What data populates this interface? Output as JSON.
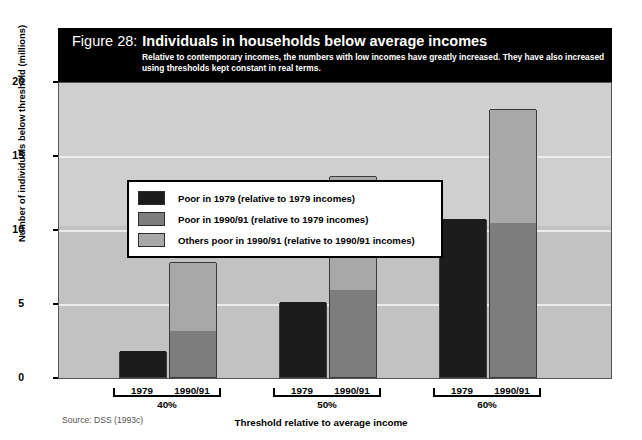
{
  "header": {
    "figure_number": "Figure 28:",
    "title": "Individuals in households below average incomes",
    "subtitle": "Relative to contemporary incomes, the numbers with low incomes have greatly increased. They have also increased using thresholds kept constant in real terms."
  },
  "source": "Source: DSS (1993c)",
  "colors": {
    "banner_background": "#000000",
    "banner_text": "#ffffff",
    "plot_background": "#c9c9c9",
    "gridline": "#ececec",
    "series_1": "#1c1c1c",
    "series_2": "#7d7d7d",
    "series_3": "#a8a8a8",
    "axis": "#000000"
  },
  "chart_data": {
    "type": "bar",
    "subtype": "stacked-grouped",
    "title": "Individuals in households below average incomes",
    "xlabel": "Threshold relative to average income",
    "ylabel": "Number of individuals below threshold (millions)",
    "ylim": [
      0,
      20
    ],
    "yticks": [
      "0",
      "5",
      "10",
      "15",
      "20"
    ],
    "ytick_values": [
      0,
      5,
      10,
      15,
      20
    ],
    "grid": true,
    "legend_position": "inside-top-left",
    "groups": [
      "40%",
      "50%",
      "60%"
    ],
    "subcategories": [
      "1979",
      "1990/91"
    ],
    "series": [
      {
        "name": "Poor in 1979 (relative to 1979 incomes)",
        "color": "#1c1c1c",
        "values": [
          1.75,
          null,
          5.1,
          null,
          10.7,
          null
        ]
      },
      {
        "name": "Poor in 1990/91 (relative to 1979 incomes)",
        "color": "#7d7d7d",
        "values": [
          null,
          3.1,
          null,
          5.85,
          null,
          10.4
        ]
      },
      {
        "name": "Others poor in 1990/91 (relative to 1990/91 incomes)",
        "color": "#a8a8a8",
        "values": [
          null,
          4.65,
          null,
          7.75,
          null,
          7.7
        ]
      }
    ],
    "bars": [
      {
        "group": "40%",
        "sub": "1979",
        "total": 1.75,
        "segments": [
          {
            "series": 0,
            "value": 1.75
          }
        ]
      },
      {
        "group": "40%",
        "sub": "1990/91",
        "total": 7.75,
        "segments": [
          {
            "series": 1,
            "value": 3.1
          },
          {
            "series": 2,
            "value": 4.65
          }
        ]
      },
      {
        "group": "50%",
        "sub": "1979",
        "total": 5.1,
        "segments": [
          {
            "series": 0,
            "value": 5.1
          }
        ]
      },
      {
        "group": "50%",
        "sub": "1990/91",
        "total": 13.6,
        "segments": [
          {
            "series": 1,
            "value": 5.85
          },
          {
            "series": 2,
            "value": 7.75
          }
        ]
      },
      {
        "group": "60%",
        "sub": "1979",
        "total": 10.7,
        "segments": [
          {
            "series": 0,
            "value": 10.7
          }
        ]
      },
      {
        "group": "60%",
        "sub": "1990/91",
        "total": 18.1,
        "segments": [
          {
            "series": 1,
            "value": 10.4
          },
          {
            "series": 2,
            "value": 7.7
          }
        ]
      }
    ]
  },
  "legend": {
    "items": [
      {
        "label": "Poor in 1979 (relative to 1979 incomes)",
        "color": "#1c1c1c"
      },
      {
        "label": "Poor in 1990/91 (relative to 1979 incomes)",
        "color": "#7d7d7d"
      },
      {
        "label": "Others poor in 1990/91 (relative to 1990/91 incomes)",
        "color": "#a8a8a8"
      }
    ]
  },
  "axis": {
    "x_title": "Threshold relative to average income",
    "y_title": "Number of individuals below threshold (millions)",
    "group_labels": [
      "40%",
      "50%",
      "60%"
    ],
    "sub_labels": [
      "1979",
      "1990/91",
      "1979",
      "1990/91",
      "1979",
      "1990/91"
    ],
    "y_tick_labels": [
      "20",
      "15",
      "10",
      "5",
      "0"
    ]
  }
}
